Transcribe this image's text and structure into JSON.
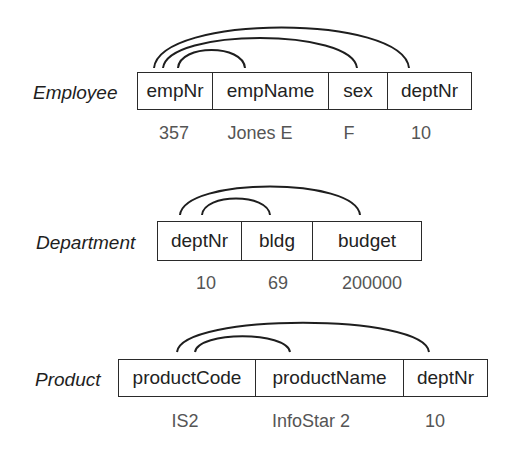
{
  "relations": [
    {
      "name": "Employee",
      "attributes": [
        "empNr",
        "empName",
        "sex",
        "deptNr"
      ],
      "sample_row": [
        "357",
        "Jones E",
        "F",
        "10"
      ]
    },
    {
      "name": "Department",
      "attributes": [
        "deptNr",
        "bldg",
        "budget"
      ],
      "sample_row": [
        "10",
        "69",
        "200000"
      ]
    },
    {
      "name": "Product",
      "attributes": [
        "productCode",
        "productName",
        "deptNr"
      ],
      "sample_row": [
        "IS2",
        "InfoStar 2",
        "10"
      ]
    }
  ],
  "dependency_arcs": [
    {
      "relation": "Employee",
      "from": "empNr",
      "to": "empName"
    },
    {
      "relation": "Employee",
      "from": "empNr",
      "to": "sex"
    },
    {
      "relation": "Employee",
      "from": "empNr",
      "to": "deptNr"
    },
    {
      "relation": "Department",
      "from": "deptNr",
      "to": "bldg"
    },
    {
      "relation": "Department",
      "from": "deptNr",
      "to": "budget"
    },
    {
      "relation": "Product",
      "from": "productCode",
      "to": "productName"
    },
    {
      "relation": "Product",
      "from": "productCode",
      "to": "deptNr"
    }
  ]
}
